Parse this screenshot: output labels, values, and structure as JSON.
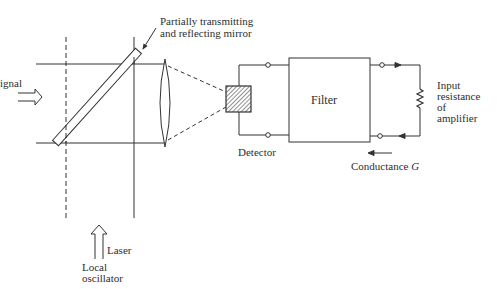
{
  "diagram": {
    "type": "optical heterodyne detection schematic",
    "labels": {
      "signal": "ignal",
      "mirror_line1": "Partially transmitting",
      "mirror_line2": "and reflecting mirror",
      "detector": "Detector",
      "filter": "Filter",
      "input_line1": "Input",
      "input_line2": "resistance",
      "input_line3": "of",
      "input_line4": "amplifier",
      "conductance_text": "Conductance ",
      "conductance_symbol": "G",
      "laser": "Laser",
      "local_line1": "Local",
      "local_line2": "oscillator"
    },
    "components": [
      "signal-arrow",
      "beam-splitter-mirror",
      "lens",
      "detector",
      "filter",
      "load-resistor",
      "local-oscillator-arrow"
    ],
    "colors": {
      "line": "#333333",
      "background": "#ffffff"
    }
  }
}
